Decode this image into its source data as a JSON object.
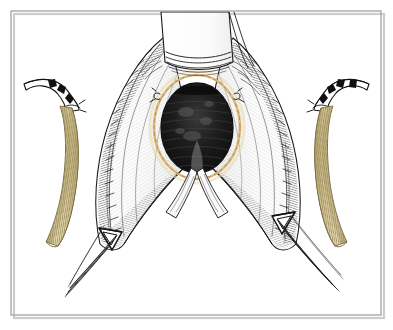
{
  "figure": {
    "kind": "surgical-illustration",
    "medium": "pen-and-ink line drawing with watercolor wash",
    "title": "",
    "caption": "",
    "background_color": "#ffffff",
    "ink_color": "#1a1a1a",
    "frame": {
      "border_color": "#a8a8a8",
      "shadow_color": "#c9c9c9",
      "x": 11,
      "y": 11,
      "width": 370,
      "height": 304
    },
    "palette": {
      "ink": "#1a1a1a",
      "hatch_gray": "#6e6e6e",
      "light_gray": "#cfcfcf",
      "cavity_dark": "#151515",
      "graft_tan": "#dccfa4",
      "graft_tan_light": "#efe6c8",
      "graft_rib": "#a8986a",
      "anastomosis_gold": "#d9b779",
      "tissue_white": "#fbfbfb",
      "paper": "#ffffff"
    },
    "parts": [
      {
        "id": "retractor-blade",
        "label": "Retractor blade",
        "description": "Flat white metal retractor blade entering from the top of the field, with curved ridge lines across its lower lip.",
        "position": "top-center"
      },
      {
        "id": "cavity-opening",
        "label": "Incised lumen / cavity",
        "description": "Dark oval opening at the center of the field, densely hatched with black ink.",
        "position": "center"
      },
      {
        "id": "anastomosis-ring",
        "label": "Suture line ring",
        "description": "Pale gold dashed ring outlining the oval opening, representing a running suture line.",
        "position": "center"
      },
      {
        "id": "stay-suture-left",
        "label": "Stay suture",
        "description": "Small knot at the upper-left edge of the opening.",
        "position": "center-left"
      },
      {
        "id": "stay-suture-right",
        "label": "Stay suture",
        "description": "Small knot at the upper-right edge of the opening.",
        "position": "center-right"
      },
      {
        "id": "tissue-flap-left",
        "label": "Retracted tissue flap",
        "description": "Left wedge of retracted tissue, cross-hatched, running from upper-center down to lower-left.",
        "position": "left"
      },
      {
        "id": "tissue-flap-right",
        "label": "Retracted tissue flap",
        "description": "Right wedge of retracted tissue, cross-hatched, running from upper-center down to lower-right.",
        "position": "right"
      },
      {
        "id": "vessel-loop-left",
        "label": "Vessel loop clip",
        "description": "Triangular loop/clip holding the left flap at its apex.",
        "position": "lower-left"
      },
      {
        "id": "vessel-loop-right",
        "label": "Vessel loop clip",
        "description": "Triangular loop/clip holding the right flap at its apex.",
        "position": "lower-right"
      },
      {
        "id": "suture-strands-left",
        "label": "Traction sutures",
        "description": "Bundle of parallel suture strands trailing down and left from the left clip.",
        "position": "bottom-left"
      },
      {
        "id": "suture-strands-right",
        "label": "Traction sutures",
        "description": "Bundle of parallel suture strands trailing down and right from the right clip.",
        "position": "bottom-right"
      },
      {
        "id": "graft-left",
        "label": "Vascular graft with cannula",
        "description": "Tan corrugated tube graft curving downward at far left, joined to a white catheter with black radio-opaque bands.",
        "position": "far-left"
      },
      {
        "id": "graft-right",
        "label": "Vascular graft with cannula",
        "description": "Tan corrugated tube graft curving downward at far right, joined to a white catheter with black radio-opaque bands.",
        "position": "far-right"
      }
    ]
  }
}
